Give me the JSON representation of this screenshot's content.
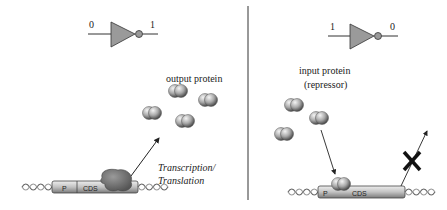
{
  "left_panel": {
    "gate": {
      "input_value": "0",
      "output_value": "1"
    },
    "protein_label": "output protein",
    "process_label_line1": "Transcription/",
    "process_label_line2": "Translation",
    "dna": {
      "promoter_label": "P",
      "cds_label": "CDS"
    }
  },
  "right_panel": {
    "gate": {
      "input_value": "1",
      "output_value": "0"
    },
    "protein_label_line1": "input protein",
    "protein_label_line2": "(repressor)",
    "dna": {
      "promoter_label": "P",
      "cds_label": "CDS"
    },
    "blocked_marker": "X"
  },
  "colors": {
    "gate_fill": "#9a9a9a",
    "protein_fill": "#a8a8a8",
    "dna_box_fill": "#c8c8c8",
    "ribosome_fill": "#7d7d7d",
    "line": "#333333"
  }
}
